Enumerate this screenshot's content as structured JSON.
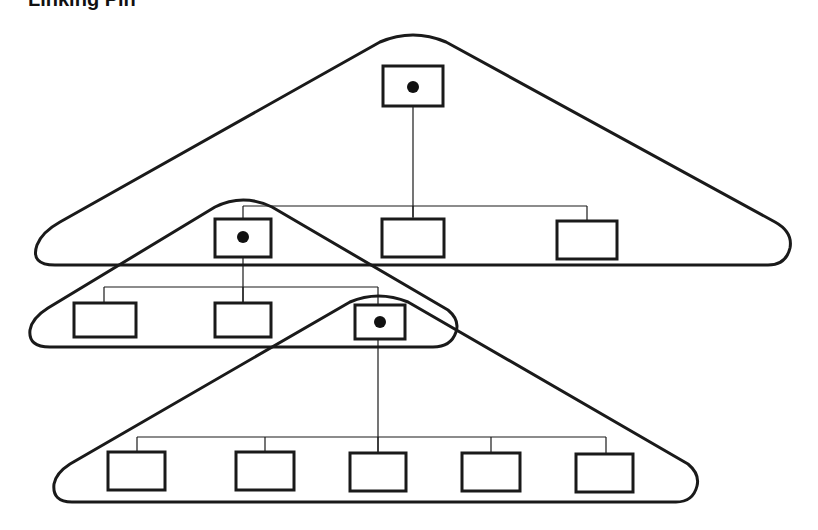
{
  "title": "Linking Pin",
  "diagram": {
    "type": "organizational-hierarchy",
    "groups": [
      {
        "name": "top-group",
        "leader": "top-unit",
        "members": [
          "mid-left-unit",
          "mid-center-unit",
          "mid-right-unit"
        ]
      },
      {
        "name": "middle-group",
        "leader": "mid-left-unit",
        "members": [
          "lower-left-unit",
          "lower-center-unit",
          "lower-right-unit"
        ]
      },
      {
        "name": "bottom-group",
        "leader": "lower-right-unit",
        "members": [
          "bottom-unit-1",
          "bottom-unit-2",
          "bottom-unit-3",
          "bottom-unit-4",
          "bottom-unit-5"
        ]
      }
    ],
    "linking_pins": [
      "top-unit",
      "mid-left-unit",
      "lower-right-unit"
    ]
  }
}
